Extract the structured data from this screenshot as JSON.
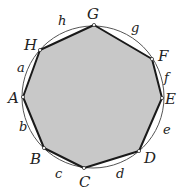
{
  "diagram": {
    "type": "inscribed-octagon",
    "circle": {
      "cx": 93,
      "cy": 97,
      "r": 71,
      "stroke": "#555555"
    },
    "polygon": {
      "fill": "#c8c8c8",
      "stroke": "#1a1a1a"
    },
    "vertices": [
      {
        "label": "A",
        "x": 23,
        "y": 97,
        "lx": 8,
        "ly": 103
      },
      {
        "label": "B",
        "x": 44,
        "y": 148,
        "lx": 30,
        "ly": 164
      },
      {
        "label": "C",
        "x": 84,
        "y": 168,
        "lx": 79,
        "ly": 187
      },
      {
        "label": "D",
        "x": 139,
        "y": 151,
        "lx": 144,
        "ly": 163
      },
      {
        "label": "E",
        "x": 162,
        "y": 98,
        "lx": 165,
        "ly": 104
      },
      {
        "label": "F",
        "x": 152,
        "y": 59,
        "lx": 158,
        "ly": 61
      },
      {
        "label": "G",
        "x": 94,
        "y": 25,
        "lx": 87,
        "ly": 19
      },
      {
        "label": "H",
        "x": 40,
        "y": 50,
        "lx": 24,
        "ly": 50
      }
    ],
    "arcs": [
      {
        "label": "a",
        "x": 17,
        "y": 72
      },
      {
        "label": "b",
        "x": 19,
        "y": 131
      },
      {
        "label": "c",
        "x": 55,
        "y": 178
      },
      {
        "label": "d",
        "x": 116,
        "y": 178
      },
      {
        "label": "e",
        "x": 163,
        "y": 134
      },
      {
        "label": "f",
        "x": 164,
        "y": 82
      },
      {
        "label": "g",
        "x": 131,
        "y": 32
      },
      {
        "label": "h",
        "x": 58,
        "y": 25
      }
    ]
  }
}
